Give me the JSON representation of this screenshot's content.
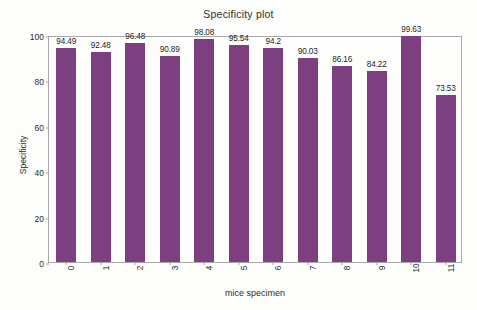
{
  "chart_data": {
    "type": "bar",
    "title": "Specificity plot",
    "xlabel": "mice specimen",
    "ylabel": "Specificity",
    "categories": [
      "0",
      "1",
      "2",
      "3",
      "4",
      "5",
      "6",
      "7",
      "8",
      "9",
      "10",
      "11"
    ],
    "values": [
      94.49,
      92.48,
      96.48,
      90.89,
      98.08,
      95.54,
      94.2,
      90.03,
      86.16,
      84.22,
      99.63,
      73.53
    ],
    "value_labels": [
      "94.49",
      "92.48",
      "96.48",
      "90.89",
      "98.08",
      "95.54",
      "94.2",
      "90.03",
      "86.16",
      "84.22",
      "99.63",
      "73.53"
    ],
    "ylim": [
      0,
      100
    ],
    "yticks": [
      0,
      20,
      40,
      60,
      80,
      100
    ],
    "ytick_labels": [
      "0",
      "20",
      "40",
      "60",
      "80",
      "100"
    ],
    "xtick_labels": [
      "0",
      "1",
      "2",
      "3",
      "4",
      "5",
      "6",
      "7",
      "8",
      "9",
      "10",
      "11"
    ],
    "grid": false,
    "legend": false,
    "bar_color": "#7e3f80",
    "frame_color": "#a9a9a9",
    "background_color": "#fdfdfb",
    "text_color": "#2d2d2d"
  }
}
